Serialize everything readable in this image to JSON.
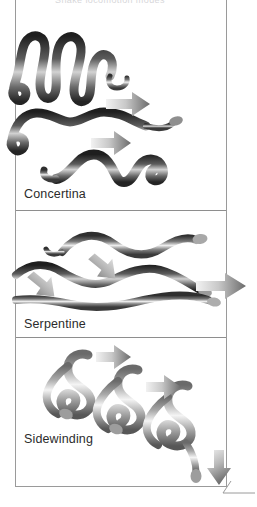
{
  "figure": {
    "title_faint": "Snake locomotion modes",
    "frame_color": "#9a9a9a",
    "background_color": "#ffffff",
    "divider_color": "#8e8e8e",
    "label_color": "#2b2b2b",
    "arrow_color_dark": "#6e6e6e",
    "arrow_color_light": "#e8e8e8",
    "snake_dark": "#3a3a3a",
    "snake_mid": "#8d8d8d",
    "snake_light": "#e6e6e6"
  },
  "sections": [
    {
      "id": "concertina",
      "label": "Concertina",
      "snake_count": 3,
      "arrow_count": 2,
      "arrow_direction": "right",
      "description": "Three stacked snake poses showing tightly bunched S-loops that are gathered then extended forward."
    },
    {
      "id": "serpentine",
      "label": "Serpentine",
      "snake_count": 3,
      "arrow_count": 3,
      "arrow_direction": "mixed",
      "description": "Three elongated smooth waves; two short arrows angle back-left against the body curves and one long arrow points right."
    },
    {
      "id": "sidewinding",
      "label": "Sidewinding",
      "snake_count": 3,
      "arrow_count": 3,
      "arrow_direction": "right-and-down",
      "description": "Three progressive S-shaped poses stepping diagonally to the right with arrows between them and one pointing down-right at the end."
    }
  ],
  "corner_mark": {
    "present": true,
    "description": "thin page-corner rule at lower right"
  }
}
